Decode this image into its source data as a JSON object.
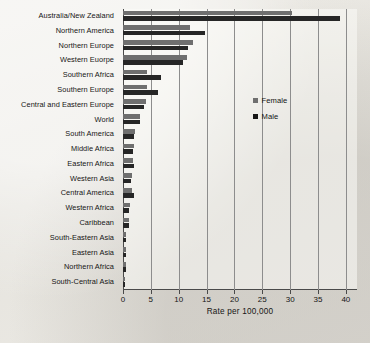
{
  "chart_data": {
    "type": "bar",
    "orientation": "horizontal",
    "title": "",
    "xlabel": "Rate per 100,000",
    "ylabel": "",
    "xlim": [
      0,
      42
    ],
    "xticks": [
      0,
      5,
      10,
      15,
      20,
      25,
      30,
      35,
      40
    ],
    "xticklabels": [
      "0",
      "5",
      "10",
      "15",
      "20",
      "25",
      "30",
      "35",
      "40"
    ],
    "grid": "vertical",
    "legend_position": "inside-right",
    "categories": [
      "Australia/New Zealand",
      "Northern America",
      "Northern Europe",
      "Western Euorpe",
      "Southern Africa",
      "Southern Europe",
      "Central and Eastern Europe",
      "World",
      "South America",
      "Middle Africa",
      "Eastern Africa",
      "Western Asia",
      "Central America",
      "Western Africa",
      "Caribbean",
      "South-Eastern Asia",
      "Eastern Asia",
      "Northern Africa",
      "South-Central Asia"
    ],
    "series": [
      {
        "name": "Female",
        "color": "#6f6f6f",
        "values": [
          30.4,
          12.0,
          12.6,
          11.5,
          4.3,
          4.3,
          4.1,
          3.0,
          2.1,
          1.9,
          1.8,
          1.6,
          1.6,
          1.2,
          1.0,
          0.6,
          0.5,
          0.5,
          0.4
        ]
      },
      {
        "name": "Male",
        "color": "#262626",
        "values": [
          38.9,
          14.7,
          11.6,
          10.8,
          6.8,
          6.2,
          3.8,
          3.0,
          2.0,
          1.8,
          2.0,
          1.4,
          1.9,
          1.1,
          1.0,
          0.6,
          0.5,
          0.5,
          0.4
        ]
      }
    ]
  },
  "legend": {
    "items": [
      {
        "label": "Female",
        "swatch": "female-swatch-icon"
      },
      {
        "label": "Male",
        "swatch": "male-swatch-icon"
      }
    ]
  }
}
